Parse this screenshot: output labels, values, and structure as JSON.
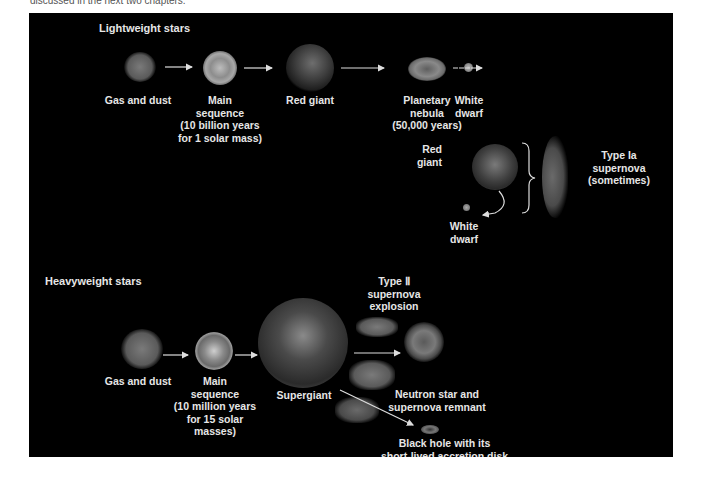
{
  "page": {
    "top_caption": "discussed in the next two chapters."
  },
  "lightweight": {
    "title": "Lightweight stars",
    "stages": [
      {
        "label": "Gas and dust"
      },
      {
        "label": "Main\nsequence\n(10 billion years\nfor 1 solar mass)"
      },
      {
        "label": "Red giant"
      },
      {
        "label": "Planetary\nnebula\n(50,000 years)"
      },
      {
        "label": "White\ndwarf"
      }
    ],
    "binary": {
      "red_giant_label": "Red\ngiant",
      "white_dwarf_label": "White\ndwarf",
      "outcome_label": "Type Ia\nsupernova\n(sometimes)"
    }
  },
  "heavyweight": {
    "title": "Heavyweight stars",
    "stages": [
      {
        "label": "Gas and dust"
      },
      {
        "label": "Main\nsequence\n(10 million years\nfor 15 solar\nmasses)"
      },
      {
        "label": "Supergiant"
      }
    ],
    "explosion_label": "Type Ⅱ\nsupernova\nexplosion",
    "outcomes": [
      {
        "label": "Neutron star and\nsupernova remnant"
      },
      {
        "label": "Black hole with its\nshort-lived accretion disk"
      }
    ]
  },
  "colors": {
    "panel_bg": "#000000",
    "text": "#e6e6e6",
    "arrow": "#dddddd"
  }
}
